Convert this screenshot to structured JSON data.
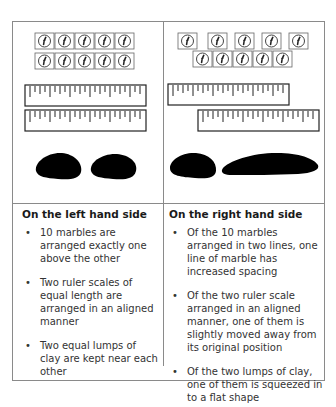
{
  "figure": {
    "left_panel": {
      "marbles": {
        "top_row_count": 5,
        "bottom_row_count": 5,
        "arrangement": "aligned",
        "icon": "marble-icon"
      },
      "rulers": {
        "count": 2,
        "arrangement": "aligned"
      },
      "clay": {
        "count": 2,
        "shapes": [
          "lump",
          "lump"
        ]
      }
    },
    "right_panel": {
      "marbles": {
        "top_row_count": 5,
        "bottom_row_count": 5,
        "arrangement": "top row spread out",
        "icon": "marble-icon"
      },
      "rulers": {
        "count": 2,
        "arrangement": "bottom ruler shifted right"
      },
      "clay": {
        "count": 2,
        "shapes": [
          "lump",
          "flattened"
        ]
      }
    },
    "colors": {
      "border": "#8a8a8a",
      "clay": "#000000",
      "ink": "#333333"
    }
  },
  "descriptions": {
    "left": {
      "heading": "On the left hand side",
      "items": [
        "10 marbles are arranged exactly one above the other",
        "Two ruler scales of equal length are arranged in an aligned manner",
        "Two equal lumps of clay are kept near each other"
      ]
    },
    "right": {
      "heading": "On the right hand side",
      "items": [
        "Of the 10 marbles arranged in two lines, one line of marble has increased spacing",
        "Of the two ruler scale arranged in an aligned manner, one of them is slightly moved away from its original position",
        "Of the two lumps of clay, one of them is squeezed in to a flat shape"
      ]
    }
  }
}
